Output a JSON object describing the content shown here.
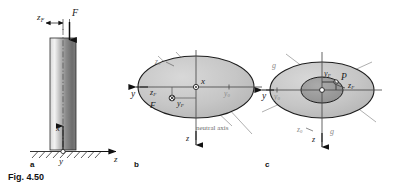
{
  "figure": {
    "caption": "Fig. 4.50",
    "panels": [
      {
        "key": "a",
        "label": "a"
      },
      {
        "key": "b",
        "label": "b"
      },
      {
        "key": "c",
        "label": "c"
      }
    ]
  },
  "panel_a": {
    "name": "column-under-eccentric-load",
    "labels": {
      "eccentricity": "z",
      "eccentricity_sub": "F",
      "force": "F",
      "axis_x": "x",
      "axis_y": "y",
      "axis_z": "z"
    },
    "colors": {
      "column_light": "#e8e8e8",
      "column_dark": "#6e6e6e",
      "outline": "#2b2b2b",
      "ground": "#3a3a3a"
    }
  },
  "panel_b": {
    "name": "elliptical-cross-section-with-neutral-axis",
    "labels": {
      "centroid_axis": "x",
      "axis_y": "y",
      "axis_z": "z",
      "y_zero": "y",
      "y_zero_sub": "0",
      "z_zero": "z",
      "z_zero_sub": "0",
      "force": "F",
      "force_z": "z",
      "force_z_sub": "F",
      "force_y": "y",
      "force_y_sub": "F",
      "neutral_axis": "neutral axis"
    },
    "colors": {
      "fill": "#c9c9c9",
      "outline": "#1f1f1f",
      "axis": "#4a4a4a",
      "construction": "#9a9a9a"
    }
  },
  "panel_c": {
    "name": "elliptical-cross-section-with-core",
    "labels": {
      "point": "P",
      "point_z": "z",
      "point_z_sub": "F",
      "point_y": "y",
      "point_y_sub": "F",
      "axis_y": "y",
      "axis_z": "z",
      "y_zero": "y",
      "y_zero_sub": "0",
      "z_zero": "z",
      "z_zero_sub": "0",
      "g_left": "g",
      "g_right": "g"
    },
    "colors": {
      "fill": "#c9c9c9",
      "core_fill": "#9e9e9e",
      "outline": "#1f1f1f",
      "axis": "#4a4a4a",
      "construction": "#9a9a9a"
    }
  }
}
